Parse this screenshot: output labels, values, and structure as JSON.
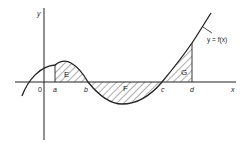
{
  "diagram": {
    "type": "area-under-curve",
    "axes": {
      "x_label": "x",
      "y_label": "y",
      "origin_label": "0"
    },
    "points": [
      "a",
      "b",
      "c",
      "d"
    ],
    "regions": [
      {
        "label": "E",
        "from": "a",
        "to": "b",
        "side": "above x-axis"
      },
      {
        "label": "F",
        "from": "b",
        "to": "c",
        "side": "below x-axis"
      },
      {
        "label": "G",
        "from": "c",
        "to": "d",
        "side": "above x-axis"
      }
    ],
    "curve_label": "y = f(x)",
    "colors": {
      "line": "#222222",
      "background": "#ffffff"
    }
  }
}
